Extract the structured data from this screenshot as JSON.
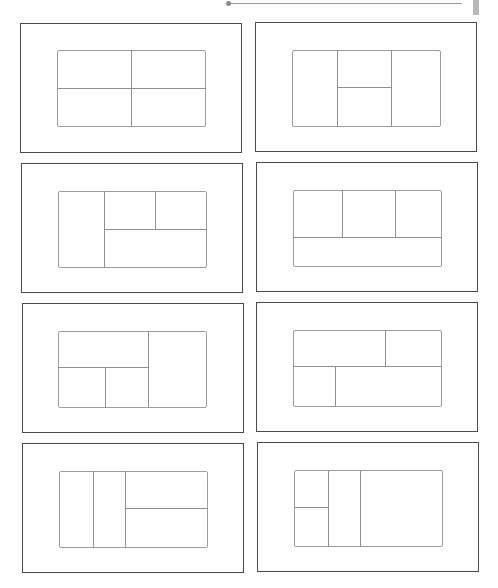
{
  "page": {
    "background": "#ffffff",
    "outer_border_color": "#4a4a4a",
    "inner_line_color": "#9c9c9c"
  },
  "header_rule": {
    "line": {
      "x1": 228,
      "x2": 462,
      "y": 3
    },
    "dot": {
      "x": 228,
      "y": 3
    },
    "tab": {
      "x": 473,
      "y": 0,
      "w": 6,
      "h": 15,
      "color": "#b8b8b8"
    }
  },
  "layouts": [
    {
      "id": 1,
      "name": "four-equal-quadrants",
      "outer": {
        "x": 20,
        "y": 23,
        "w": 222,
        "h": 130
      },
      "inner": {
        "x": 57,
        "y": 50,
        "w": 149,
        "h": 77
      },
      "vlines": [
        {
          "x": 131,
          "y1": 50,
          "y2": 127
        }
      ],
      "hlines": [
        {
          "y": 88,
          "x1": 57,
          "x2": 206
        }
      ]
    },
    {
      "id": 2,
      "name": "three-columns-middle-split",
      "outer": {
        "x": 255,
        "y": 22,
        "w": 222,
        "h": 130
      },
      "inner": {
        "x": 292,
        "y": 50,
        "w": 149,
        "h": 77
      },
      "vlines": [
        {
          "x": 337,
          "y1": 50,
          "y2": 127
        },
        {
          "x": 391,
          "y1": 50,
          "y2": 127
        }
      ],
      "hlines": [
        {
          "y": 87,
          "x1": 337,
          "x2": 391
        }
      ]
    },
    {
      "id": 3,
      "name": "left-column-right-two-top-one-bottom",
      "outer": {
        "x": 21,
        "y": 163,
        "w": 222,
        "h": 130
      },
      "inner": {
        "x": 58,
        "y": 191,
        "w": 149,
        "h": 77
      },
      "vlines": [
        {
          "x": 104,
          "y1": 191,
          "y2": 268
        },
        {
          "x": 155,
          "y1": 191,
          "y2": 229
        }
      ],
      "hlines": [
        {
          "y": 229,
          "x1": 104,
          "x2": 207
        }
      ]
    },
    {
      "id": 4,
      "name": "three-top-one-wide-bottom",
      "outer": {
        "x": 256,
        "y": 162,
        "w": 222,
        "h": 130
      },
      "inner": {
        "x": 293,
        "y": 190,
        "w": 149,
        "h": 77
      },
      "vlines": [
        {
          "x": 342,
          "y1": 190,
          "y2": 237
        },
        {
          "x": 395,
          "y1": 190,
          "y2": 237
        }
      ],
      "hlines": [
        {
          "y": 237,
          "x1": 293,
          "x2": 442
        }
      ]
    },
    {
      "id": 5,
      "name": "left-top-wide-bottom-two-right-column",
      "outer": {
        "x": 22,
        "y": 303,
        "w": 222,
        "h": 130
      },
      "inner": {
        "x": 58,
        "y": 331,
        "w": 149,
        "h": 77
      },
      "vlines": [
        {
          "x": 148,
          "y1": 331,
          "y2": 408
        },
        {
          "x": 105,
          "y1": 367,
          "y2": 408
        }
      ],
      "hlines": [
        {
          "y": 367,
          "x1": 58,
          "x2": 148
        }
      ]
    },
    {
      "id": 6,
      "name": "top-wide-narrow-bottom-narrow-wide",
      "outer": {
        "x": 256,
        "y": 302,
        "w": 222,
        "h": 130
      },
      "inner": {
        "x": 293,
        "y": 330,
        "w": 149,
        "h": 77
      },
      "vlines": [
        {
          "x": 385,
          "y1": 330,
          "y2": 366
        },
        {
          "x": 335,
          "y1": 366,
          "y2": 407
        }
      ],
      "hlines": [
        {
          "y": 366,
          "x1": 293,
          "x2": 442
        }
      ]
    },
    {
      "id": 7,
      "name": "two-narrow-columns-right-split",
      "outer": {
        "x": 22,
        "y": 443,
        "w": 222,
        "h": 130
      },
      "inner": {
        "x": 59,
        "y": 471,
        "w": 149,
        "h": 77
      },
      "vlines": [
        {
          "x": 93,
          "y1": 471,
          "y2": 548
        },
        {
          "x": 125,
          "y1": 471,
          "y2": 548
        }
      ],
      "hlines": [
        {
          "y": 508,
          "x1": 125,
          "x2": 208
        }
      ]
    },
    {
      "id": 8,
      "name": "left-split-narrow-column-wide-right",
      "outer": {
        "x": 257,
        "y": 442,
        "w": 222,
        "h": 130
      },
      "inner": {
        "x": 294,
        "y": 470,
        "w": 149,
        "h": 77
      },
      "vlines": [
        {
          "x": 328,
          "y1": 470,
          "y2": 547
        },
        {
          "x": 360,
          "y1": 470,
          "y2": 547
        }
      ],
      "hlines": [
        {
          "y": 507,
          "x1": 294,
          "x2": 328
        }
      ]
    }
  ]
}
